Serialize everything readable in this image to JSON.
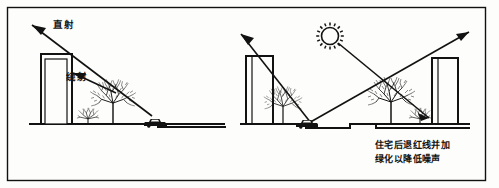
{
  "figure": {
    "border_color": "#111111",
    "background_color": "#fdfdfb",
    "ink_color": "#121212",
    "panels": [
      {
        "id": "left-panel",
        "name": "unmitigated-condition",
        "labels": [
          {
            "id": "direct-ray",
            "text": "直射"
          },
          {
            "id": "diffracted-ray",
            "text": "绕射"
          }
        ],
        "elements": [
          "tall-building",
          "large-tree",
          "small-shrub",
          "roadway-vehicle",
          "ground-line",
          "direct-ray-arrow",
          "diffracted-ray-arrow"
        ]
      },
      {
        "id": "right-panel",
        "name": "mitigated-condition",
        "caption": {
          "line1": "住宅后退红线并加",
          "line2": "绿化以降低噪声"
        },
        "labels": [],
        "elements": [
          "noise-source-sun",
          "left-building",
          "right-building",
          "left-tree",
          "center-tree",
          "right-shrub",
          "sunken-roadway-vehicle",
          "ground-line",
          "reflected-ray-arrow-left",
          "reflected-ray-arrow-right",
          "incident-ray-arrow"
        ]
      }
    ]
  }
}
